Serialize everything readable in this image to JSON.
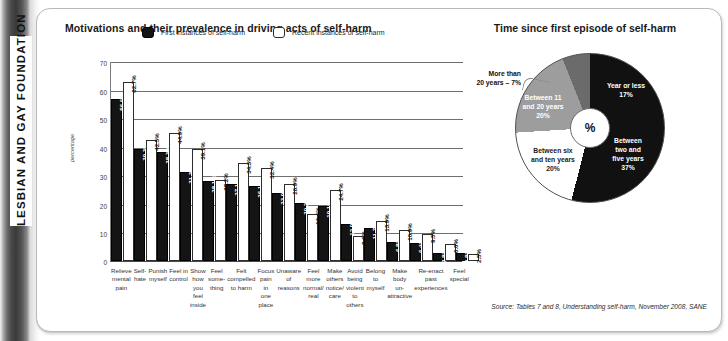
{
  "spine": {
    "label": "LESBIAN AND GAY FOUNDATION"
  },
  "bar_chart_title": "Motivations and their prevalence in driving acts of self-harm",
  "pie_chart_title": "Time since first episode of self-harm",
  "legend": {
    "first_label": "First instances of self-harm",
    "recent_label": "Recent instances of self-harm"
  },
  "source": "Source: Tables 7 and 8, Understanding self-harm,  November 2008, SANE",
  "pie_center_symbol": "%",
  "colors": {
    "first_series": "#141414",
    "recent_series": "#ffffff",
    "pie_dark": "#111111",
    "pie_white": "#ffffff",
    "pie_grey": "#9d9d9d",
    "pie_dark_grey": "#6b6b6b"
  },
  "chart_data": [
    {
      "type": "bar",
      "title": "Motivations and their prevalence in driving acts of self-harm",
      "xlabel": "",
      "ylabel": "percentage",
      "ylim": [
        0,
        70
      ],
      "yticks": [
        70,
        60,
        50,
        40,
        30,
        20,
        10,
        0
      ],
      "grid": true,
      "legend_position": "top-center",
      "categories": [
        "Relieve mental pain",
        "Self-hate",
        "Punish myself",
        "Feel in control",
        "Show how you feel inside",
        "Feel some-thing",
        "Felt compelled to harm",
        "Focus pain in one place",
        "Unaware of reasons",
        "Feel more normal/ real",
        "Make others notice/ care",
        "Avoid being violent to others",
        "Belong to myself",
        "Make body un-attractive",
        "Re-enact past experiences",
        "Feel special"
      ],
      "category_lines": [
        [
          "Relieve",
          "mental",
          "pain"
        ],
        [
          "Self-hate"
        ],
        [
          "Punish",
          "myself"
        ],
        [
          "Feel in",
          "control"
        ],
        [
          "Show how",
          "you feel",
          "inside"
        ],
        [
          "Feel",
          "some-",
          "thing"
        ],
        [
          "Felt",
          "compelled",
          "to harm"
        ],
        [
          "Focus",
          "pain in",
          "one place"
        ],
        [
          "Unaware",
          "of",
          "reasons"
        ],
        [
          "Feel",
          "more",
          "normal/",
          "real"
        ],
        [
          "Make",
          "others",
          "notice/",
          "care"
        ],
        [
          "Avoid",
          "being",
          "violent",
          "to others"
        ],
        [
          "Belong",
          "to myself"
        ],
        [
          "Make",
          "body",
          "un-",
          "attractive"
        ],
        [
          "Re-enact",
          "past",
          "experiences"
        ],
        [
          "Feel",
          "special"
        ]
      ],
      "series": [
        {
          "name": "First instances of self-harm",
          "values": [
            56.6,
            39.3,
            38.3,
            31.3,
            28.1,
            27.1,
            26.1,
            23.9,
            20.2,
            19.1,
            12.9,
            11.7,
            6.8,
            6.4,
            2.8,
            2.8
          ],
          "labels": [
            "56.6%",
            "39.3%",
            "38.3%",
            "31.3%",
            "28.1%",
            "27.1%",
            "26.1%",
            "23.9%",
            "20.2%",
            "19.1%",
            "12.9%",
            "11.7%",
            "6.8%",
            "6.4%",
            "2.8%",
            "2.8%"
          ]
        },
        {
          "name": "Recent instances of self-harm",
          "values": [
            62.7,
            42.5,
            44.9,
            39.1,
            28.2,
            34.3,
            32.4,
            26.9,
            16.4,
            24.7,
            8.6,
            13.9,
            10.9,
            9.5,
            6.0,
            2.5
          ],
          "labels": [
            "62.7%",
            "42.5%",
            "44.9%",
            "39.1%",
            "28.2%",
            "34.3%",
            "32.4%",
            "26.9%",
            "16.4%",
            "24.7%",
            "8.6%",
            "13.9%",
            "10.9%",
            "9.5%",
            "6.0%",
            "2.5%"
          ]
        }
      ]
    },
    {
      "type": "pie",
      "title": "Time since first episode of self-harm",
      "center_label": "%",
      "slices": [
        {
          "label": "Year or less",
          "label_lines": "Year or less\n17%",
          "value": 17,
          "color": "#111111"
        },
        {
          "label": "Between two and five years",
          "label_lines": "Between\ntwo and\nfive years\n37%",
          "value": 37,
          "color": "#111111"
        },
        {
          "label": "Between six and ten years",
          "label_lines": "Between six\nand ten years\n20%",
          "value": 20,
          "color": "#ffffff"
        },
        {
          "label": "Between 11 and 20 years",
          "label_lines": "Between 11\nand 20 years\n20%",
          "value": 20,
          "color": "#9d9d9d"
        },
        {
          "label": "More than 20 years",
          "label_lines": "More than\n20 years – 7%",
          "value": 7,
          "color": "#6b6b6b"
        }
      ]
    }
  ]
}
